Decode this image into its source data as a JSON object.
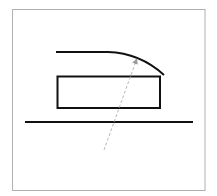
{
  "diagram": {
    "elements": [
      {
        "id": "frame",
        "kind": "border"
      },
      {
        "id": "top-curve",
        "kind": "curve",
        "shape": "horizontal line bending downward at the right end"
      },
      {
        "id": "rectangle",
        "kind": "rectangle"
      },
      {
        "id": "ground-line",
        "kind": "line"
      },
      {
        "id": "dashed-arrow",
        "kind": "dashed arrow",
        "direction": "from lower-left to upper-right, ending on the curve"
      }
    ],
    "colors": {
      "background": "#ffffff",
      "frame": "#b0b0b0",
      "stroke": "#111111",
      "dashed": "#b8b8b8"
    },
    "labels": []
  }
}
